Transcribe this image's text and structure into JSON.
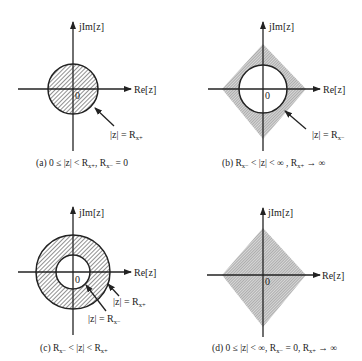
{
  "panels": [
    {
      "id": "a",
      "axis_y_label": "jIm[z]",
      "axis_x_label": "Re[z]",
      "origin_label": "0",
      "annotations": [
        {
          "text_main": "|z| = R",
          "text_sub": "x+"
        }
      ],
      "caption": {
        "prefix": "(a) 0 ≤ |z| < R",
        "sub1": "x+",
        "mid": ", R",
        "sub2": "x−",
        "suffix": " = 0"
      },
      "region": "disc interior (hatched)"
    },
    {
      "id": "b",
      "axis_y_label": "jIm[z]",
      "axis_x_label": "Re[z]",
      "origin_label": "0",
      "annotations": [
        {
          "text_main": "|z| = R",
          "text_sub": "x−"
        }
      ],
      "caption": {
        "prefix": "(b) R",
        "sub1": "x−",
        "mid": " < |z| < ∞  , R",
        "sub2": "x+",
        "suffix": " → ∞"
      },
      "region": "exterior of circle (shaded)"
    },
    {
      "id": "c",
      "axis_y_label": "jIm[z]",
      "axis_x_label": "Re[z]",
      "origin_label": "0",
      "annotations": [
        {
          "text_main": "|z| = R",
          "text_sub": "x+"
        },
        {
          "text_main": "|z| = R",
          "text_sub": "x−"
        }
      ],
      "caption": {
        "prefix": "(c) R",
        "sub1": "x−",
        "mid": " < |z| < R",
        "sub2": "x+",
        "suffix": ""
      },
      "region": "annulus (hatched)"
    },
    {
      "id": "d",
      "axis_y_label": "jIm[z]",
      "axis_x_label": "Re[z]",
      "origin_label": "0",
      "annotations": [],
      "caption": {
        "prefix": "(d) 0 ≤ |z| < ∞, R",
        "sub1": "x−",
        "mid": " = 0, R",
        "sub2": "x+",
        "suffix": " → ∞"
      },
      "region": "entire plane (shaded)"
    }
  ]
}
